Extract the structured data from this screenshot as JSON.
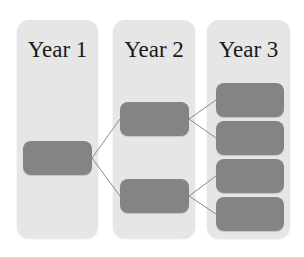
{
  "diagram": {
    "type": "tree",
    "colors": {
      "column_bg": "#e6e6e6",
      "node_fill": "#848484",
      "connector": "#8a8a8a",
      "title_text": "#1a1a1a"
    },
    "columns": [
      {
        "title": "Year 1",
        "node_count": 1
      },
      {
        "title": "Year 2",
        "node_count": 2
      },
      {
        "title": "Year 3",
        "node_count": 4
      }
    ],
    "edges": [
      {
        "from": "y1-n1",
        "to": "y2-n1"
      },
      {
        "from": "y1-n1",
        "to": "y2-n2"
      },
      {
        "from": "y2-n1",
        "to": "y3-n1"
      },
      {
        "from": "y2-n1",
        "to": "y3-n2"
      },
      {
        "from": "y2-n2",
        "to": "y3-n3"
      },
      {
        "from": "y2-n2",
        "to": "y3-n4"
      }
    ]
  }
}
